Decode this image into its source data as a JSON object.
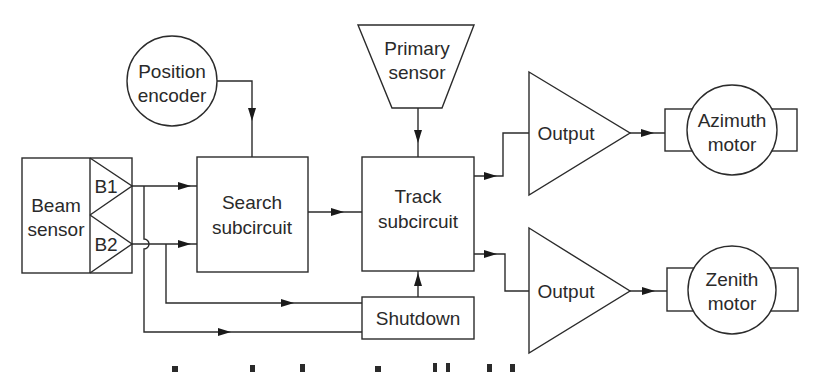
{
  "diagram": {
    "blocks": {
      "beam_sensor": {
        "line1": "Beam",
        "line2": "sensor"
      },
      "b1": {
        "label": "B1"
      },
      "b2": {
        "label": "B2"
      },
      "position_encoder": {
        "line1": "Position",
        "line2": "encoder"
      },
      "search": {
        "line1": "Search",
        "line2": "subcircuit"
      },
      "primary_sensor": {
        "line1": "Primary",
        "line2": "sensor"
      },
      "track": {
        "line1": "Track",
        "line2": "subcircuit"
      },
      "shutdown": {
        "label": "Shutdown"
      },
      "output_upper": {
        "label": "Output"
      },
      "output_lower": {
        "label": "Output"
      },
      "azimuth_motor": {
        "line1": "Azimuth",
        "line2": "motor"
      },
      "zenith_motor": {
        "line1": "Zenith",
        "line2": "motor"
      }
    },
    "connections": [
      {
        "from": "b1",
        "to": "search"
      },
      {
        "from": "b2",
        "to": "search"
      },
      {
        "from": "b2",
        "to": "shutdown"
      },
      {
        "from": "b1",
        "to": "shutdown"
      },
      {
        "from": "position_encoder",
        "to": "search"
      },
      {
        "from": "search",
        "to": "track"
      },
      {
        "from": "primary_sensor",
        "to": "track"
      },
      {
        "from": "shutdown",
        "to": "track"
      },
      {
        "from": "track",
        "to": "output_upper"
      },
      {
        "from": "track",
        "to": "output_lower"
      },
      {
        "from": "output_upper",
        "to": "azimuth_motor"
      },
      {
        "from": "output_lower",
        "to": "zenith_motor"
      }
    ],
    "colors": {
      "stroke": "#2b2b2b",
      "background": "#ffffff",
      "text": "#2a2a2a"
    }
  }
}
